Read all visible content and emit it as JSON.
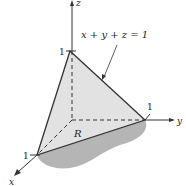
{
  "figure": {
    "equation": "x + y + z = 1",
    "region_label": "R",
    "axes": {
      "x": "x",
      "y": "y",
      "z": "z"
    },
    "ticks": {
      "x": "1",
      "y": "1",
      "z": "1"
    },
    "colors": {
      "plane": "#e2e2e2",
      "shadow": "#b5b5b5",
      "line": "#333333"
    }
  }
}
